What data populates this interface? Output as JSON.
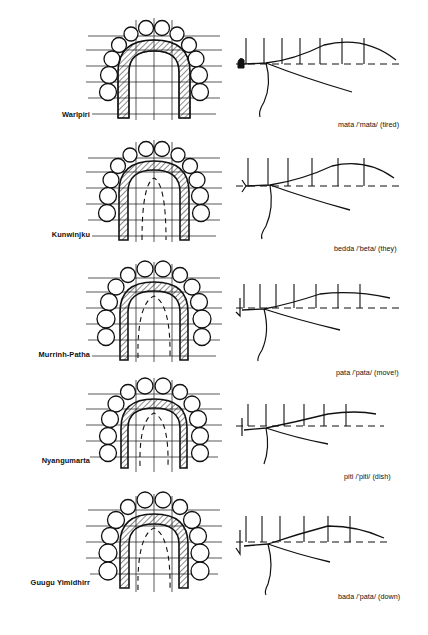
{
  "figure": {
    "type": "palatogram-array",
    "rows": [
      {
        "language": "Warlpiri",
        "caption": "mata /'mata/ (tired)",
        "word": "mata",
        "ipa": "/'mata/",
        "gloss": "(tired)",
        "palatogram": {
          "contact_band": "wide",
          "band_inner_offset": 11,
          "dashed_inner_line": false,
          "grid_rows": 6,
          "grid_cols": 3
        },
        "trace": {
          "ticks": 7,
          "tick_height": 26,
          "baseline_y": 46,
          "curve_peak_y": 20,
          "curve_peak_x": 118
        }
      },
      {
        "language": "Kunwinjku",
        "caption": "bedda /'beta/ (they)",
        "word": "bedda",
        "ipa": "/'beta/",
        "gloss": "(they)",
        "palatogram": {
          "contact_band": "medium",
          "band_inner_offset": 9,
          "dashed_inner_line": true,
          "grid_rows": 6,
          "grid_cols": 3
        },
        "trace": {
          "ticks": 6,
          "tick_height": 28,
          "baseline_y": 46,
          "curve_peak_y": 22,
          "curve_peak_x": 126
        }
      },
      {
        "language": "Murrinh-Patha",
        "caption": "pata /'pata/ (move!)",
        "word": "pata",
        "ipa": "/'pata/",
        "gloss": "(move!)",
        "palatogram": {
          "contact_band": "narrow",
          "band_inner_offset": 8,
          "dashed_inner_line": true,
          "grid_rows": 6,
          "grid_cols": 3
        },
        "trace": {
          "ticks": 7,
          "tick_height": 24,
          "baseline_y": 46,
          "curve_peak_y": 25,
          "curve_peak_x": 112
        }
      },
      {
        "language": "Nyangumarta",
        "caption": "piti /'piti/ (dish)",
        "word": "piti",
        "ipa": "/'piti/",
        "gloss": "(dish)",
        "palatogram": {
          "contact_band": "narrow",
          "band_inner_offset": 7,
          "dashed_inner_line": true,
          "grid_rows": 5,
          "grid_cols": 3
        },
        "trace": {
          "ticks": 6,
          "tick_height": 22,
          "baseline_y": 46,
          "curve_peak_y": 27,
          "curve_peak_x": 120
        }
      },
      {
        "language": "Guugu Yimidhirr",
        "caption": "bada /'pata/ (down)",
        "word": "bada",
        "ipa": "/'pata/",
        "gloss": "(down)",
        "palatogram": {
          "contact_band": "medium",
          "band_inner_offset": 10,
          "dashed_inner_line": true,
          "grid_rows": 5,
          "grid_cols": 3
        },
        "trace": {
          "ticks": 6,
          "tick_height": 26,
          "baseline_y": 46,
          "curve_peak_y": 24,
          "curve_peak_x": 116
        }
      }
    ]
  },
  "style": {
    "ink": "#111111",
    "background": "#ffffff"
  }
}
